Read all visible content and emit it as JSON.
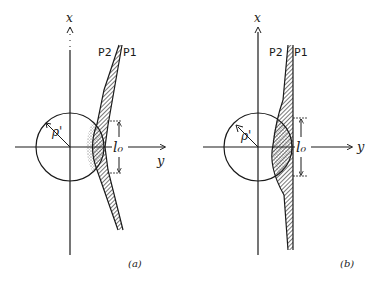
{
  "figure": {
    "panels": [
      {
        "id": "a",
        "caption": "(a)",
        "x_axis_label": "x",
        "y_axis_label": "y",
        "radius_label": "ρ'",
        "length_label": "l₀",
        "plate_labels": [
          "P2",
          "P1"
        ]
      },
      {
        "id": "b",
        "caption": "(b)",
        "x_axis_label": "x",
        "y_axis_label": "y",
        "radius_label": "ρ'",
        "length_label": "l₀",
        "plate_labels": [
          "P2",
          "P1"
        ]
      }
    ]
  }
}
